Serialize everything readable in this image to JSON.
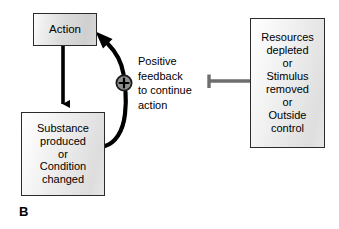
{
  "figure": {
    "panel_letter": "B",
    "type": "positive-feedback-loop-diagram",
    "background_color": "#ffffff",
    "text_color": "#000000"
  },
  "nodes": {
    "action": {
      "label": "Action",
      "lines": [
        "Action"
      ],
      "fill": "#d8d8d8",
      "border_color": "#2b2b2b"
    },
    "substance": {
      "lines": [
        "Substance",
        "produced",
        "or",
        "Condition",
        "changed"
      ],
      "fill": "#e8e8e8",
      "border_color": "#2b2b2b"
    },
    "resources": {
      "lines": [
        "Resources",
        "depleted",
        "or",
        "Stimulus",
        "removed",
        "or",
        "Outside",
        "control"
      ],
      "fill": "#e8e8e8",
      "border_color": "#2b2b2b"
    },
    "plus": {
      "symbol": "+",
      "fill": "#8f8f8f",
      "border_color": "#1a1a1a"
    }
  },
  "annotations": {
    "feedback": {
      "lines": [
        "Positive",
        "feedback",
        "to continue",
        "action"
      ],
      "full_text": "Positive feedback to continue action"
    }
  },
  "connectors": {
    "action_to_substance": {
      "name": "stimulating-arrow-down",
      "style": "solid-arrow",
      "color": "#000000"
    },
    "substance_to_action": {
      "name": "positive-feedback-curve",
      "style": "curved-arrow",
      "color": "#000000"
    },
    "resources_to_feedback": {
      "name": "inhibition-connector",
      "style": "blunt-end-bar",
      "color": "#6e6e6e"
    }
  }
}
